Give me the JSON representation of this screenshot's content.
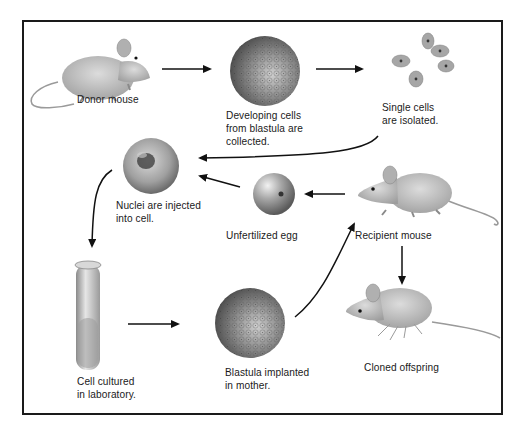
{
  "diagram": {
    "title": "",
    "labels": {
      "donor_mouse": "Donor mouse",
      "developing_cells": "Developing cells\nfrom blastula are\ncollected.",
      "single_cells": "Single cells\nare isolated.",
      "nuclei_injected": "Nuclei are injected\ninto cell.",
      "unfertilized_egg": "Unfertilized egg",
      "recipient_mouse": "Recipient mouse",
      "cell_cultured": "Cell cultured\nin laboratory.",
      "blastula_implanted": "Blastula implanted\nin mother.",
      "cloned_offspring": "Cloned offspring"
    },
    "flow": [
      {
        "from": "donor_mouse",
        "to": "developing_cells"
      },
      {
        "from": "developing_cells",
        "to": "single_cells"
      },
      {
        "from": "single_cells",
        "to": "nuclei_injected"
      },
      {
        "from": "recipient_mouse",
        "to": "unfertilized_egg"
      },
      {
        "from": "unfertilized_egg",
        "to": "nuclei_injected"
      },
      {
        "from": "nuclei_injected",
        "to": "cell_cultured"
      },
      {
        "from": "cell_cultured",
        "to": "blastula_implanted"
      },
      {
        "from": "blastula_implanted",
        "to": "recipient_mouse"
      },
      {
        "from": "recipient_mouse",
        "to": "cloned_offspring"
      }
    ],
    "colors": {
      "frame": "#1a1a1a",
      "arrow": "#111111",
      "mouse_fur": "#b9b9b9",
      "cell_dark": "#6a6a6a",
      "egg": "#9a9a9a"
    }
  }
}
